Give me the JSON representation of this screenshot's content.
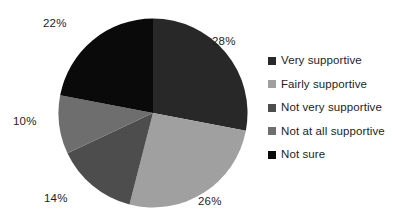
{
  "chart_data": {
    "type": "pie",
    "title": "",
    "xlabel": "",
    "ylabel": "",
    "legend_position": "right",
    "grid": false,
    "start_angle_deg": 0,
    "direction": "clockwise",
    "categories": [
      "Very supportive",
      "Fairly supportive",
      "Not very supportive",
      "Not at all supportive",
      "Not sure"
    ],
    "values": [
      28,
      26,
      14,
      10,
      22
    ],
    "data_labels": [
      "28%",
      "26%",
      "14%",
      "10%",
      "22%"
    ],
    "colors": [
      "#282828",
      "#a0a0a0",
      "#4d4d4d",
      "#6e6e6e",
      "#0a0a0a"
    ],
    "slices": [
      {
        "label": "Very supportive",
        "value": 28,
        "data_label": "28%",
        "color": "#282828"
      },
      {
        "label": "Fairly supportive",
        "value": 26,
        "data_label": "26%",
        "color": "#a0a0a0"
      },
      {
        "label": "Not very supportive",
        "value": 14,
        "data_label": "14%",
        "color": "#4d4d4d"
      },
      {
        "label": "Not at all supportive",
        "value": 10,
        "data_label": "10%",
        "color": "#6e6e6e"
      },
      {
        "label": "Not sure",
        "value": 22,
        "data_label": "22%",
        "color": "#0a0a0a"
      }
    ]
  },
  "legend": {
    "items": [
      {
        "label": "Very supportive",
        "color": "#282828"
      },
      {
        "label": "Fairly supportive",
        "color": "#a0a0a0"
      },
      {
        "label": "Not very supportive",
        "color": "#4d4d4d"
      },
      {
        "label": "Not at all supportive",
        "color": "#6e6e6e"
      },
      {
        "label": "Not sure",
        "color": "#0a0a0a"
      }
    ]
  }
}
